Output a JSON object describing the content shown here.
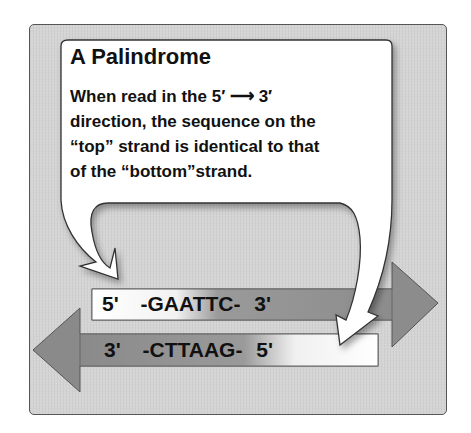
{
  "callout": {
    "title": "A Palindrome",
    "lines": [
      "When read in the 5′ ⟶ 3′",
      "direction, the sequence on the",
      "“top” strand is identical to that",
      "of the “bottom”strand."
    ]
  },
  "strands": {
    "top": {
      "left_end": "5'",
      "sequence": "-GAATTC-",
      "right_end": "3'",
      "direction": "right"
    },
    "bottom": {
      "left_end": "3'",
      "sequence": "-CTTAAG-",
      "right_end": "5'",
      "direction": "left"
    }
  },
  "colors": {
    "panel": "#d4d4d4",
    "arrow_gray": "#8a8a8a",
    "callout_fill": "#ffffff",
    "text": "#111111"
  }
}
